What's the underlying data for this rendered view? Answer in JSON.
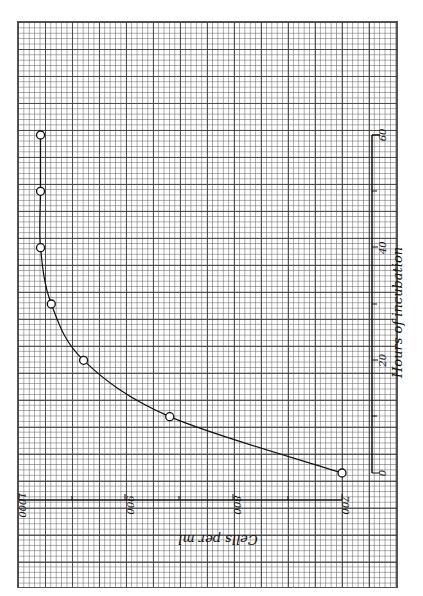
{
  "chart_data": {
    "type": "line",
    "title": "",
    "xlabel": "Hours of incubation",
    "ylabel": "Cells per ml",
    "x_ticks": [
      "0",
      "20",
      "40",
      "60"
    ],
    "y_ticks": [
      "700",
      "800",
      "900",
      "1000"
    ],
    "xlim": [
      0,
      60
    ],
    "ylim": [
      700,
      1000
    ],
    "grid": true,
    "orientation": "rotated 90° (page turned sideways); hours axis vertical, cells axis horizontal with labels upside down",
    "x": [
      0,
      10,
      20,
      30,
      40,
      50,
      60
    ],
    "series": [
      {
        "name": "Cells per ml",
        "values": [
          700,
          860,
          940,
          970,
          980,
          980,
          980
        ],
        "marker": "open-circle"
      }
    ]
  }
}
